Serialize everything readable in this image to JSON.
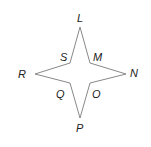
{
  "diagram": {
    "type": "four-pointed-star",
    "stroke_color": "#888888",
    "label_color": "#222222",
    "vertices": [
      {
        "name": "L",
        "x": 80,
        "y": 27
      },
      {
        "name": "M",
        "x": 90,
        "y": 63
      },
      {
        "name": "N",
        "x": 126,
        "y": 74
      },
      {
        "name": "O",
        "x": 90,
        "y": 83
      },
      {
        "name": "P",
        "x": 80,
        "y": 118
      },
      {
        "name": "Q",
        "x": 70,
        "y": 83
      },
      {
        "name": "R",
        "x": 35,
        "y": 74
      },
      {
        "name": "S",
        "x": 70,
        "y": 63
      }
    ],
    "labels": [
      {
        "text": "L",
        "x": 77,
        "y": 22
      },
      {
        "text": "S",
        "x": 60,
        "y": 61
      },
      {
        "text": "M",
        "x": 93,
        "y": 61
      },
      {
        "text": "R",
        "x": 18,
        "y": 78
      },
      {
        "text": "N",
        "x": 130,
        "y": 77
      },
      {
        "text": "Q",
        "x": 56,
        "y": 98
      },
      {
        "text": "O",
        "x": 92,
        "y": 98
      },
      {
        "text": "P",
        "x": 76,
        "y": 132
      }
    ]
  }
}
